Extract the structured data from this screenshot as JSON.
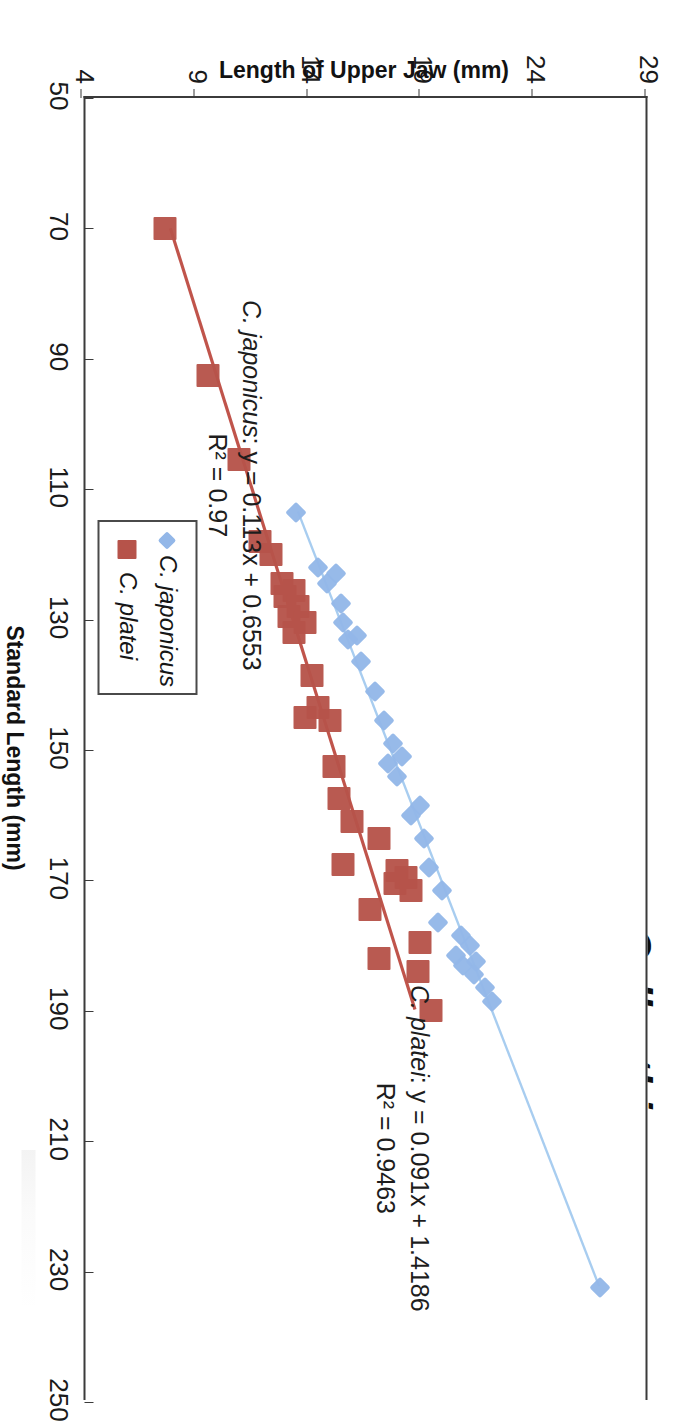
{
  "chart_data": {
    "type": "scatter",
    "title": "Callanthias",
    "xlabel": "Standard Length (mm)",
    "ylabel": "Length of Upper Jaw (mm)",
    "xlim": [
      50,
      250
    ],
    "ylim": [
      4,
      29
    ],
    "xticks": [
      50,
      70,
      90,
      110,
      130,
      150,
      170,
      190,
      210,
      230,
      250
    ],
    "yticks": [
      4,
      9,
      14,
      19,
      24,
      29
    ],
    "grid": false,
    "legend_position": "bottom-right-inside",
    "series": [
      {
        "name": "C. japonicus",
        "marker": "diamond",
        "color": "#93b7e8",
        "line_color": "#a8cdf0",
        "points": [
          [
            113.5,
            13.5
          ],
          [
            122.0,
            14.5
          ],
          [
            123.0,
            15.3
          ],
          [
            124.5,
            14.9
          ],
          [
            127.5,
            15.5
          ],
          [
            130.5,
            15.6
          ],
          [
            132.5,
            16.2
          ],
          [
            133.0,
            15.8
          ],
          [
            136.5,
            16.4
          ],
          [
            141.0,
            17.0
          ],
          [
            145.5,
            17.4
          ],
          [
            149.0,
            17.8
          ],
          [
            151.0,
            18.2
          ],
          [
            152.0,
            17.6
          ],
          [
            154.0,
            18.0
          ],
          [
            158.5,
            19.0
          ],
          [
            160.0,
            18.6
          ],
          [
            163.5,
            19.2
          ],
          [
            168.0,
            19.4
          ],
          [
            171.5,
            20.0
          ],
          [
            176.5,
            19.8
          ],
          [
            178.5,
            20.8
          ],
          [
            180.0,
            21.2
          ],
          [
            181.5,
            20.6
          ],
          [
            182.5,
            21.5
          ],
          [
            183.0,
            20.9
          ],
          [
            184.5,
            21.4
          ],
          [
            186.5,
            21.9
          ],
          [
            188.5,
            22.2
          ],
          [
            232.5,
            27.0
          ]
        ],
        "fit": {
          "slope": 0.113,
          "intercept": 0.6553,
          "r2": 0.97,
          "equation": "C. japonicus: y = 0.113x + 0.6553",
          "r2_label": "R² = 0.97"
        }
      },
      {
        "name": "C. platei",
        "marker": "square",
        "color": "#b6534a",
        "line_color": "#c0544b",
        "points": [
          [
            70.0,
            7.7
          ],
          [
            92.5,
            9.6
          ],
          [
            105.5,
            11.0
          ],
          [
            118.0,
            11.9
          ],
          [
            120.0,
            12.4
          ],
          [
            124.5,
            12.9
          ],
          [
            125.5,
            13.4
          ],
          [
            126.5,
            13.0
          ],
          [
            128.0,
            13.6
          ],
          [
            129.5,
            13.2
          ],
          [
            130.5,
            13.9
          ],
          [
            132.0,
            13.4
          ],
          [
            138.5,
            14.2
          ],
          [
            143.5,
            14.5
          ],
          [
            145.0,
            13.9
          ],
          [
            145.5,
            15.0
          ],
          [
            152.5,
            15.2
          ],
          [
            157.5,
            15.4
          ],
          [
            161.0,
            16.0
          ],
          [
            163.5,
            17.2
          ],
          [
            167.5,
            15.6
          ],
          [
            168.5,
            18.0
          ],
          [
            169.5,
            18.4
          ],
          [
            170.5,
            17.9
          ],
          [
            171.5,
            18.6
          ],
          [
            174.5,
            16.8
          ],
          [
            179.5,
            19.0
          ],
          [
            182.0,
            17.2
          ],
          [
            184.0,
            18.9
          ],
          [
            190.0,
            19.5
          ]
        ],
        "fit": {
          "slope": 0.091,
          "intercept": 1.4186,
          "r2": 0.9463,
          "equation": "C. platei: y = 0.091x + 1.4186",
          "r2_label": "R² = 0.9463"
        }
      }
    ],
    "annotations": [
      {
        "id": "japonicus-fit",
        "line1_species": "C. japonicus",
        "line1_rest": ": y = 0.113x + 0.6553",
        "line2": "R² = 0.97"
      },
      {
        "id": "platei-fit",
        "line1_species": "C. platei",
        "line1_rest": ": y = 0.091x + 1.4186",
        "line2": "R² = 0.9463"
      }
    ],
    "legend": [
      {
        "label": "C. japonicus",
        "marker": "diamond",
        "color": "#93b7e8"
      },
      {
        "label": "C. platei",
        "marker": "square",
        "color": "#b6534a"
      }
    ]
  }
}
